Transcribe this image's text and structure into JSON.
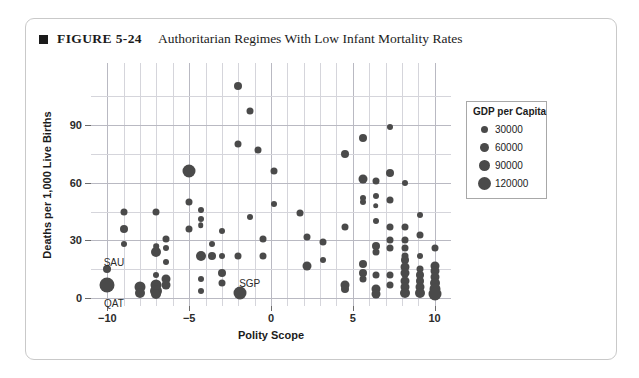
{
  "figure": {
    "bullet_icon": "filled-square-icon",
    "number": "FIGURE 5-24",
    "title": "Authoritarian Regimes With Low Infant Mortality Rates"
  },
  "legend": {
    "title": "GDP per Capita",
    "position": "right",
    "entries": [
      {
        "label": "30000",
        "value": 30000,
        "px": 7
      },
      {
        "label": "60000",
        "value": 60000,
        "px": 9
      },
      {
        "label": "90000",
        "value": 90000,
        "px": 11
      },
      {
        "label": "120000",
        "value": 120000,
        "px": 13
      }
    ]
  },
  "colors": {
    "marker": "#4a4a4a",
    "grid": "#d5d5db",
    "axis_text": "#2b2b2b",
    "card_border": "#c9c9c9",
    "legend_border": "#a8a8a8"
  },
  "chart_data": {
    "type": "scatter",
    "title": "Authoritarian Regimes With Low Infant Mortality Rates",
    "xlabel": "Polity Scope",
    "ylabel": "Deaths per 1,000 Live Births",
    "xlim": [
      -11,
      11
    ],
    "ylim": [
      -4,
      122
    ],
    "xticks": [
      -10,
      -5,
      0,
      5,
      10
    ],
    "yticks": [
      0,
      30,
      60,
      90
    ],
    "x_minor_gridlines": [
      -10,
      -9,
      -8,
      -7,
      -6,
      -5,
      -4,
      -3,
      -2,
      -1,
      0,
      1,
      2,
      3,
      4,
      5,
      6,
      7,
      8,
      9,
      10
    ],
    "y_minor_gridlines": [
      0,
      15,
      30,
      45,
      60,
      75,
      90,
      105
    ],
    "grid": true,
    "size_encoding": "GDP per Capita",
    "annotations": [
      {
        "text": "SAU",
        "x": -9.6,
        "y": 19.0
      },
      {
        "text": "QAT",
        "x": -9.6,
        "y": -2.5
      },
      {
        "text": "SGP",
        "x": -1.3,
        "y": 8.0
      }
    ],
    "points": [
      {
        "x": -10,
        "y": 15,
        "r": 4.0
      },
      {
        "x": -10,
        "y": 7,
        "r": 7.5
      },
      {
        "x": -9,
        "y": 45,
        "r": 3.5
      },
      {
        "x": -9,
        "y": 36,
        "r": 4.0
      },
      {
        "x": -9,
        "y": 28,
        "r": 3.0
      },
      {
        "x": -8,
        "y": 6,
        "r": 5.5
      },
      {
        "x": -8,
        "y": 3,
        "r": 5.0
      },
      {
        "x": -7,
        "y": 45,
        "r": 3.5
      },
      {
        "x": -7,
        "y": 24,
        "r": 5.0
      },
      {
        "x": -7,
        "y": 27,
        "r": 2.8
      },
      {
        "x": -7,
        "y": 12,
        "r": 3.0
      },
      {
        "x": -7,
        "y": 7,
        "r": 5.5
      },
      {
        "x": -7,
        "y": 4,
        "r": 6.0
      },
      {
        "x": -7,
        "y": 2,
        "r": 5.0
      },
      {
        "x": -6.4,
        "y": 31,
        "r": 3.5
      },
      {
        "x": -6.4,
        "y": 26,
        "r": 3.0
      },
      {
        "x": -6.4,
        "y": 19,
        "r": 3.0
      },
      {
        "x": -6.4,
        "y": 10,
        "r": 4.5
      },
      {
        "x": -6.4,
        "y": 7,
        "r": 4.5
      },
      {
        "x": -5,
        "y": 66,
        "r": 6.5
      },
      {
        "x": -5,
        "y": 50,
        "r": 3.5
      },
      {
        "x": -5,
        "y": 36,
        "r": 3.5
      },
      {
        "x": -4.3,
        "y": 46,
        "r": 3.0
      },
      {
        "x": -4.3,
        "y": 41,
        "r": 3.0
      },
      {
        "x": -4.3,
        "y": 38,
        "r": 2.8
      },
      {
        "x": -4.3,
        "y": 22,
        "r": 5.0
      },
      {
        "x": -4.3,
        "y": 10,
        "r": 3.0
      },
      {
        "x": -4.3,
        "y": 4,
        "r": 3.0
      },
      {
        "x": -3.6,
        "y": 28,
        "r": 3.0
      },
      {
        "x": -3.6,
        "y": 22,
        "r": 4.0
      },
      {
        "x": -3,
        "y": 35,
        "r": 3.0
      },
      {
        "x": -3,
        "y": 22,
        "r": 3.0
      },
      {
        "x": -3,
        "y": 13,
        "r": 4.0
      },
      {
        "x": -3,
        "y": 8,
        "r": 3.5
      },
      {
        "x": -2,
        "y": 110,
        "r": 4.0
      },
      {
        "x": -2,
        "y": 80,
        "r": 3.5
      },
      {
        "x": -2,
        "y": 22,
        "r": 3.5
      },
      {
        "x": -1.9,
        "y": 3,
        "r": 6.5
      },
      {
        "x": -1.3,
        "y": 97,
        "r": 3.5
      },
      {
        "x": -1.3,
        "y": 42,
        "r": 3.0
      },
      {
        "x": -0.8,
        "y": 77,
        "r": 3.5
      },
      {
        "x": -0.5,
        "y": 31,
        "r": 3.5
      },
      {
        "x": -0.5,
        "y": 22,
        "r": 3.5
      },
      {
        "x": 0.2,
        "y": 66,
        "r": 3.5
      },
      {
        "x": 0.2,
        "y": 49,
        "r": 3.0
      },
      {
        "x": 1.8,
        "y": 44,
        "r": 3.5
      },
      {
        "x": 2.2,
        "y": 32,
        "r": 3.5
      },
      {
        "x": 2.2,
        "y": 17,
        "r": 4.5
      },
      {
        "x": 3.2,
        "y": 29,
        "r": 3.5
      },
      {
        "x": 3.2,
        "y": 20,
        "r": 3.0
      },
      {
        "x": 4.5,
        "y": 75,
        "r": 4.0
      },
      {
        "x": 4.5,
        "y": 37,
        "r": 3.5
      },
      {
        "x": 4.5,
        "y": 7,
        "r": 4.5
      },
      {
        "x": 4.5,
        "y": 5,
        "r": 4.0
      },
      {
        "x": 5.6,
        "y": 83,
        "r": 4.0
      },
      {
        "x": 5.6,
        "y": 62,
        "r": 4.5
      },
      {
        "x": 5.6,
        "y": 52,
        "r": 3.0
      },
      {
        "x": 5.6,
        "y": 50,
        "r": 3.0
      },
      {
        "x": 5.6,
        "y": 18,
        "r": 4.0
      },
      {
        "x": 5.6,
        "y": 13,
        "r": 4.0
      },
      {
        "x": 5.6,
        "y": 10,
        "r": 3.5
      },
      {
        "x": 6.4,
        "y": 61,
        "r": 3.5
      },
      {
        "x": 6.4,
        "y": 53,
        "r": 3.0
      },
      {
        "x": 6.4,
        "y": 48,
        "r": 2.8
      },
      {
        "x": 6.4,
        "y": 40,
        "r": 3.0
      },
      {
        "x": 6.4,
        "y": 27,
        "r": 4.0
      },
      {
        "x": 6.4,
        "y": 24,
        "r": 3.5
      },
      {
        "x": 6.4,
        "y": 12,
        "r": 3.5
      },
      {
        "x": 6.4,
        "y": 5,
        "r": 4.5
      },
      {
        "x": 6.4,
        "y": 2,
        "r": 4.5
      },
      {
        "x": 7.3,
        "y": 89,
        "r": 3.0
      },
      {
        "x": 7.3,
        "y": 65,
        "r": 4.0
      },
      {
        "x": 7.3,
        "y": 51,
        "r": 3.5
      },
      {
        "x": 7.3,
        "y": 37,
        "r": 3.5
      },
      {
        "x": 7.3,
        "y": 30,
        "r": 3.5
      },
      {
        "x": 7.3,
        "y": 26,
        "r": 3.5
      },
      {
        "x": 7.3,
        "y": 12,
        "r": 3.5
      },
      {
        "x": 7.3,
        "y": 7,
        "r": 3.5
      },
      {
        "x": 8.2,
        "y": 60,
        "r": 3.0
      },
      {
        "x": 8.2,
        "y": 37,
        "r": 3.5
      },
      {
        "x": 8.2,
        "y": 30,
        "r": 3.5
      },
      {
        "x": 8.2,
        "y": 26,
        "r": 3.5
      },
      {
        "x": 8.2,
        "y": 22,
        "r": 3.5
      },
      {
        "x": 8.2,
        "y": 20,
        "r": 4.0
      },
      {
        "x": 8.2,
        "y": 16,
        "r": 4.5
      },
      {
        "x": 8.2,
        "y": 13,
        "r": 4.5
      },
      {
        "x": 8.2,
        "y": 9,
        "r": 4.5
      },
      {
        "x": 8.2,
        "y": 6,
        "r": 4.5
      },
      {
        "x": 8.2,
        "y": 3,
        "r": 5.0
      },
      {
        "x": 9.1,
        "y": 43,
        "r": 3.0
      },
      {
        "x": 9.1,
        "y": 33,
        "r": 3.5
      },
      {
        "x": 9.1,
        "y": 22,
        "r": 3.0
      },
      {
        "x": 9.1,
        "y": 15,
        "r": 3.5
      },
      {
        "x": 9.1,
        "y": 12,
        "r": 4.0
      },
      {
        "x": 9.1,
        "y": 9,
        "r": 4.0
      },
      {
        "x": 9.1,
        "y": 6,
        "r": 4.5
      },
      {
        "x": 9.1,
        "y": 3,
        "r": 5.0
      },
      {
        "x": 10,
        "y": 26,
        "r": 3.5
      },
      {
        "x": 10,
        "y": 17,
        "r": 4.5
      },
      {
        "x": 10,
        "y": 14,
        "r": 4.5
      },
      {
        "x": 10,
        "y": 11,
        "r": 4.5
      },
      {
        "x": 10,
        "y": 8,
        "r": 5.0
      },
      {
        "x": 10,
        "y": 5,
        "r": 5.5
      },
      {
        "x": 10,
        "y": 2,
        "r": 6.5
      }
    ]
  }
}
